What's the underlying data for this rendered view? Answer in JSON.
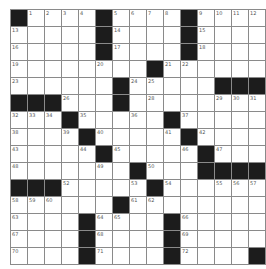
{
  "puzzle": {
    "rows": 15,
    "cols": 15,
    "grid": [
      "#....#....#....",
      ".....#....#....",
      ".....#....#....",
      "........#......",
      "......#.....###",
      "###...#........",
      "...#.....#.....",
      "....#.....#....",
      ".....#.....#...",
      ".......#...####",
      "###.....#......",
      "......#........",
      "....#....#.....",
      "....#....#.....",
      "....#....#....#"
    ],
    "numbers": [
      [
        0,
        1,
        1
      ],
      [
        0,
        2,
        2
      ],
      [
        0,
        3,
        3
      ],
      [
        0,
        4,
        4
      ],
      [
        0,
        6,
        5
      ],
      [
        0,
        7,
        6
      ],
      [
        0,
        8,
        7
      ],
      [
        0,
        9,
        8
      ],
      [
        0,
        11,
        9
      ],
      [
        0,
        12,
        10
      ],
      [
        0,
        13,
        11
      ],
      [
        0,
        14,
        12
      ],
      [
        1,
        0,
        13
      ],
      [
        1,
        6,
        14
      ],
      [
        1,
        11,
        15
      ],
      [
        2,
        0,
        16
      ],
      [
        2,
        6,
        17
      ],
      [
        2,
        11,
        18
      ],
      [
        3,
        0,
        19
      ],
      [
        3,
        5,
        20
      ],
      [
        3,
        9,
        21
      ],
      [
        3,
        10,
        22
      ],
      [
        4,
        0,
        23
      ],
      [
        4,
        7,
        24
      ],
      [
        4,
        8,
        25
      ],
      [
        5,
        3,
        26
      ],
      [
        5,
        6,
        27
      ],
      [
        5,
        8,
        28
      ],
      [
        5,
        12,
        29
      ],
      [
        5,
        13,
        30
      ],
      [
        5,
        14,
        31
      ],
      [
        6,
        0,
        32
      ],
      [
        6,
        1,
        33
      ],
      [
        6,
        2,
        34
      ],
      [
        6,
        4,
        35
      ],
      [
        6,
        7,
        36
      ],
      [
        6,
        10,
        37
      ],
      [
        7,
        0,
        38
      ],
      [
        7,
        3,
        39
      ],
      [
        7,
        5,
        40
      ],
      [
        7,
        9,
        41
      ],
      [
        7,
        11,
        42
      ],
      [
        8,
        0,
        43
      ],
      [
        8,
        4,
        44
      ],
      [
        8,
        6,
        45
      ],
      [
        8,
        10,
        46
      ],
      [
        8,
        12,
        47
      ],
      [
        9,
        0,
        48
      ],
      [
        9,
        5,
        49
      ],
      [
        9,
        8,
        50
      ],
      [
        9,
        11,
        51
      ],
      [
        10,
        3,
        52
      ],
      [
        10,
        7,
        53
      ],
      [
        10,
        9,
        54
      ],
      [
        10,
        12,
        55
      ],
      [
        10,
        13,
        56
      ],
      [
        10,
        14,
        57
      ],
      [
        11,
        0,
        58
      ],
      [
        11,
        1,
        59
      ],
      [
        11,
        2,
        60
      ],
      [
        11,
        7,
        61
      ],
      [
        11,
        8,
        62
      ],
      [
        12,
        0,
        63
      ],
      [
        12,
        5,
        64
      ],
      [
        12,
        6,
        65
      ],
      [
        12,
        10,
        66
      ],
      [
        13,
        0,
        67
      ],
      [
        13,
        5,
        68
      ],
      [
        13,
        10,
        69
      ],
      [
        14,
        0,
        70
      ],
      [
        14,
        5,
        71
      ],
      [
        14,
        10,
        72
      ]
    ]
  }
}
